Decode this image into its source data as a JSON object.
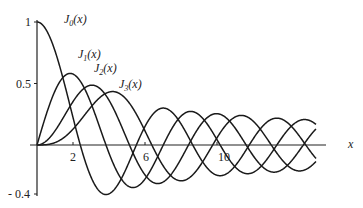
{
  "chart_data": {
    "type": "line",
    "title": "",
    "xlabel": "x",
    "ylabel": "",
    "xlim": [
      0,
      14
    ],
    "ylim": [
      -0.4,
      1
    ],
    "x_ticks": [
      "2",
      "6",
      "10"
    ],
    "y_ticks": [
      "1",
      "0.5",
      "- 0.4"
    ],
    "grid": false,
    "legend": "inline labels",
    "series": [
      {
        "name": "J0(x)",
        "label_main": "J",
        "label_sub": "0",
        "label_tail": "(x)"
      },
      {
        "name": "J1(x)",
        "label_main": "J",
        "label_sub": "1",
        "label_tail": "(x)"
      },
      {
        "name": "J2(x)",
        "label_main": "J",
        "label_sub": "2",
        "label_tail": "(x)"
      },
      {
        "name": "J3(x)",
        "label_main": "J",
        "label_sub": "3",
        "label_tail": "(x)"
      }
    ]
  }
}
